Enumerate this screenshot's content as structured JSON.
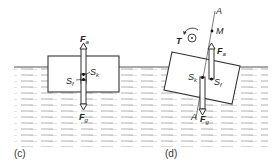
{
  "diagram": {
    "panels": [
      {
        "id": "c",
        "caption": "(c)",
        "forces": {
          "buoyancy": {
            "symbol": "F",
            "sub": "a"
          },
          "gravity": {
            "symbol": "F",
            "sub": "g"
          }
        },
        "points": {
          "center_of_buoyancy": {
            "symbol": "S",
            "sub": "f"
          },
          "center_of_gravity": {
            "symbol": "S",
            "sub": "k"
          }
        }
      },
      {
        "id": "d",
        "caption": "(d)",
        "forces": {
          "buoyancy": {
            "symbol": "F",
            "sub": "a"
          },
          "gravity": {
            "symbol": "F",
            "sub": "g"
          }
        },
        "points": {
          "center_of_buoyancy": {
            "symbol": "S",
            "sub": "f"
          },
          "center_of_gravity": {
            "symbol": "S",
            "sub": "k"
          },
          "metacenter": {
            "symbol": "M"
          }
        },
        "axis_labels": {
          "top": "A",
          "bottom": "A"
        },
        "torque": {
          "symbol": "T"
        }
      }
    ],
    "colors": {
      "line": "#333333",
      "water_dash": "#9a9a9a",
      "background": "#ffffff"
    }
  }
}
